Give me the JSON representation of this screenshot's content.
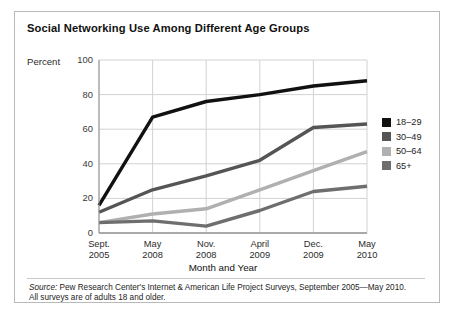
{
  "figure": {
    "title": "Social Networking Use Among Different Age Groups",
    "y_axis_label": "Percent",
    "x_axis_title": "Month and Year",
    "source_prefix": "Source:",
    "source_text": " Pew Research Center's Internet & American Life Project Surveys, September 2005—May 2010.",
    "source_line2": "All surveys are of adults 18 and older."
  },
  "chart_data": {
    "type": "line",
    "title": "Social Networking Use Among Different Age Groups",
    "xlabel": "Month and Year",
    "ylabel": "Percent",
    "ylim": [
      0,
      100
    ],
    "yticks": [
      0,
      20,
      40,
      60,
      80,
      100
    ],
    "grid": true,
    "legend_position": "right",
    "categories": [
      "Sept.\n2005",
      "May\n2008",
      "Nov.\n2008",
      "April\n2009",
      "Dec.\n2009",
      "May\n2010"
    ],
    "categories_line1": [
      "Sept.",
      "May",
      "Nov.",
      "April",
      "Dec.",
      "May"
    ],
    "categories_line2": [
      "2005",
      "2008",
      "2008",
      "2009",
      "2009",
      "2010"
    ],
    "series": [
      {
        "name": "18–29",
        "color": "#111111",
        "values": [
          16,
          67,
          76,
          80,
          85,
          88
        ]
      },
      {
        "name": "30–49",
        "color": "#555555",
        "values": [
          12,
          25,
          33,
          42,
          61,
          63
        ]
      },
      {
        "name": "50–64",
        "color": "#b0b0b0",
        "values": [
          6,
          11,
          14,
          25,
          36,
          47
        ]
      },
      {
        "name": "65+",
        "color": "#6e6e6e",
        "values": [
          6,
          7,
          4,
          13,
          24,
          27
        ]
      }
    ]
  }
}
